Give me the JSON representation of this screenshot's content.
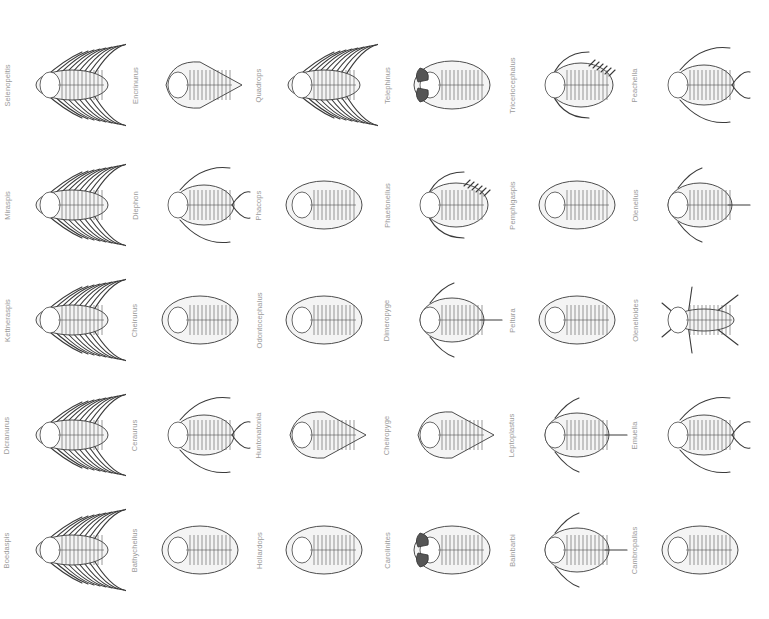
{
  "figure": {
    "rows": [
      {
        "cells": [
          {
            "label": "Selenopeltis",
            "body": "spiny",
            "eyes": "none"
          },
          {
            "label": "Encrinurus",
            "body": "tapered",
            "eyes": "none"
          },
          {
            "label": "Quadrops",
            "body": "spiny",
            "eyes": "none"
          },
          {
            "label": "Telephinus",
            "body": "oval",
            "eyes": "dark"
          },
          {
            "label": "Triceriocephalus",
            "body": "spined-oval",
            "eyes": "none"
          },
          {
            "label": "Peachella",
            "body": "horned",
            "eyes": "none"
          }
        ]
      },
      {
        "cells": [
          {
            "label": "Miraspis",
            "body": "spiny",
            "eyes": "none"
          },
          {
            "label": "Diephon",
            "body": "horned",
            "eyes": "none"
          },
          {
            "label": "Phacops",
            "body": "oval",
            "eyes": "none"
          },
          {
            "label": "Phaetonellus",
            "body": "spined-oval",
            "eyes": "none"
          },
          {
            "label": "Pemphigaspis",
            "body": "oval",
            "eyes": "none"
          },
          {
            "label": "Olenellus",
            "body": "tailspine",
            "eyes": "none"
          }
        ]
      },
      {
        "cells": [
          {
            "label": "Kettneraspis",
            "body": "spiny",
            "eyes": "none"
          },
          {
            "label": "Cheirurus",
            "body": "oval",
            "eyes": "none"
          },
          {
            "label": "Odontocephalus",
            "body": "oval",
            "eyes": "none"
          },
          {
            "label": "Dimeropyge",
            "body": "tailspine",
            "eyes": "none"
          },
          {
            "label": "Pelturа",
            "body": "oval",
            "eyes": "none"
          },
          {
            "label": "Olenelloides",
            "body": "star",
            "eyes": "none"
          }
        ]
      },
      {
        "cells": [
          {
            "label": "Dicranurus",
            "body": "spiny",
            "eyes": "none"
          },
          {
            "label": "Ceraurus",
            "body": "horned",
            "eyes": "none"
          },
          {
            "label": "Huntonatonia",
            "body": "tapered",
            "eyes": "none"
          },
          {
            "label": "Cheiropyge",
            "body": "tapered",
            "eyes": "none"
          },
          {
            "label": "Leptoplastus",
            "body": "tailspine",
            "eyes": "none"
          },
          {
            "label": "Emuella",
            "body": "horned",
            "eyes": "none"
          }
        ]
      },
      {
        "cells": [
          {
            "label": "Boedaspis",
            "body": "spiny",
            "eyes": "none"
          },
          {
            "label": "Bathycheilus",
            "body": "oval",
            "eyes": "none"
          },
          {
            "label": "Hollardops",
            "body": "oval",
            "eyes": "none"
          },
          {
            "label": "Carolinites",
            "body": "oval",
            "eyes": "dark"
          },
          {
            "label": "Bainbarbi",
            "body": "tailspine",
            "eyes": "none"
          },
          {
            "label": "Cambropallas",
            "body": "oval",
            "eyes": "none"
          }
        ]
      }
    ]
  }
}
